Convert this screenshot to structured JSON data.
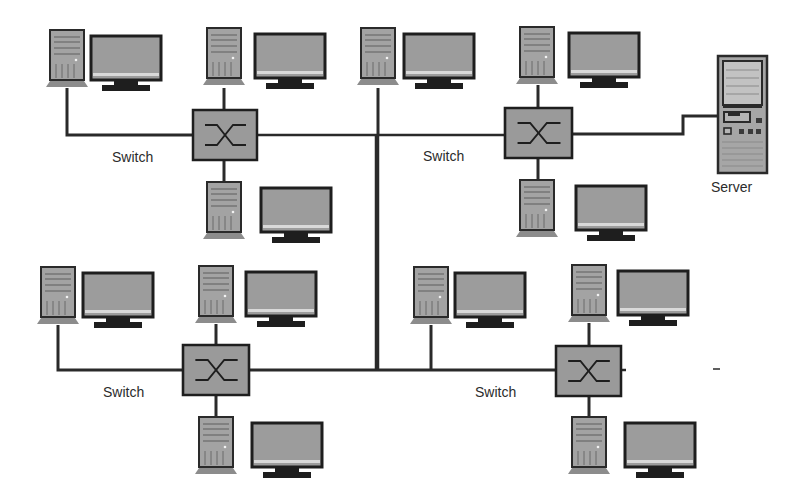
{
  "diagram": {
    "type": "network-topology",
    "colors": {
      "background": "#ffffff",
      "line": "#2a2a2a",
      "device_fill": "#9a9a9a",
      "device_border": "#2a2a2a",
      "tower_base": "#8c8c8c",
      "screen_fill": "#9c9c9c",
      "label": "#2b2b2b"
    },
    "labels": {
      "switch": "Switch",
      "server": "Server"
    },
    "switches": [
      {
        "id": "switch-top-left",
        "label": "Switch",
        "x": 193,
        "y": 110,
        "w": 64,
        "h": 50,
        "label_x": 112,
        "label_y": 150
      },
      {
        "id": "switch-top-right",
        "label": "Switch",
        "x": 505,
        "y": 108,
        "w": 67,
        "h": 50,
        "label_x": 423,
        "label_y": 149
      },
      {
        "id": "switch-bottom-left",
        "label": "Switch",
        "x": 183,
        "y": 345,
        "w": 66,
        "h": 50,
        "label_x": 103,
        "label_y": 385
      },
      {
        "id": "switch-bottom-right",
        "label": "Switch",
        "x": 556,
        "y": 346,
        "w": 65,
        "h": 50,
        "label_x": 475,
        "label_y": 385
      }
    ],
    "workstations": [
      {
        "id": "ws-tl-1",
        "tower_x": 46,
        "tower_y": 30,
        "monitor_x": 90,
        "monitor_y": 35
      },
      {
        "id": "ws-tl-2",
        "tower_x": 203,
        "tower_y": 28,
        "monitor_x": 254,
        "monitor_y": 33
      },
      {
        "id": "ws-tl-3",
        "tower_x": 203,
        "tower_y": 182,
        "monitor_x": 260,
        "monitor_y": 187
      },
      {
        "id": "ws-mid",
        "tower_x": 357,
        "tower_y": 28,
        "monitor_x": 403,
        "monitor_y": 33
      },
      {
        "id": "ws-tr-1",
        "tower_x": 516,
        "tower_y": 27,
        "monitor_x": 568,
        "monitor_y": 32
      },
      {
        "id": "ws-tr-2",
        "tower_x": 516,
        "tower_y": 180,
        "monitor_x": 575,
        "monitor_y": 185
      },
      {
        "id": "ws-bl-1",
        "tower_x": 37,
        "tower_y": 267,
        "monitor_x": 82,
        "monitor_y": 272
      },
      {
        "id": "ws-bl-2",
        "tower_x": 195,
        "tower_y": 266,
        "monitor_x": 245,
        "monitor_y": 271
      },
      {
        "id": "ws-bl-3",
        "tower_x": 195,
        "tower_y": 417,
        "monitor_x": 251,
        "monitor_y": 422
      },
      {
        "id": "ws-br-1",
        "tower_x": 410,
        "tower_y": 267,
        "monitor_x": 454,
        "monitor_y": 272
      },
      {
        "id": "ws-br-2",
        "tower_x": 568,
        "tower_y": 265,
        "monitor_x": 617,
        "monitor_y": 270
      },
      {
        "id": "ws-br-3",
        "tower_x": 568,
        "tower_y": 417,
        "monitor_x": 624,
        "monitor_y": 422
      }
    ],
    "server": {
      "id": "server",
      "label": "Server",
      "x": 718,
      "y": 56,
      "w": 49,
      "h": 117,
      "label_x": 711,
      "label_y": 180
    }
  }
}
